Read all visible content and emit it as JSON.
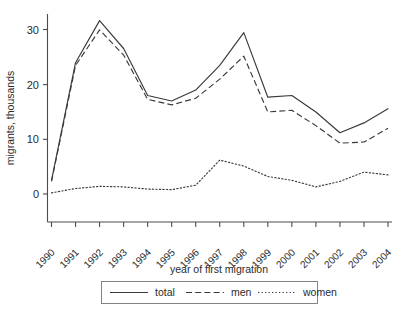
{
  "chart_data": {
    "type": "line",
    "title": "",
    "xlabel": "year of first migration",
    "ylabel": "migrants, thousands",
    "categories": [
      "1990",
      "1991",
      "1992",
      "1993",
      "1994",
      "1995",
      "1996",
      "1997",
      "1998",
      "1999",
      "2000",
      "2001",
      "2002",
      "2003",
      "2004"
    ],
    "x": [
      1990,
      1991,
      1992,
      1993,
      1994,
      1995,
      1996,
      1997,
      1998,
      1999,
      2000,
      2001,
      2002,
      2003,
      2004
    ],
    "series": [
      {
        "name": "total",
        "style": "solid",
        "values": [
          2.5,
          24.0,
          31.7,
          26.6,
          18.0,
          17.0,
          19.0,
          23.5,
          29.5,
          17.7,
          18.0,
          15.0,
          11.2,
          13.0,
          15.6
        ]
      },
      {
        "name": "men",
        "style": "dashed",
        "values": [
          2.3,
          23.5,
          30.0,
          25.4,
          17.3,
          16.3,
          17.5,
          21.0,
          25.2,
          15.0,
          15.3,
          12.5,
          9.3,
          9.5,
          12.0
        ]
      },
      {
        "name": "women",
        "style": "dotted",
        "values": [
          0.2,
          1.0,
          1.4,
          1.3,
          0.9,
          0.8,
          1.6,
          6.2,
          5.1,
          3.2,
          2.5,
          1.3,
          2.3,
          4.0,
          3.5
        ]
      }
    ],
    "ylim": [
      0,
      33
    ],
    "yticks": [
      0,
      10,
      20,
      30
    ],
    "ytick_labels": [
      "0",
      "10",
      "20",
      "30"
    ],
    "xlim": [
      1990,
      2004
    ],
    "grid": false,
    "legend_position": "bottom",
    "legend_entries": [
      "total",
      "men",
      "women"
    ],
    "axis_color": "#4d4d4d",
    "line_color": "#3a3a3a",
    "background": "#ffffff"
  },
  "legend": {
    "total_label": "total",
    "men_label": "men",
    "women_label": "women"
  },
  "axes": {
    "y_title": "migrants, thousands",
    "x_title": "year of first migration"
  }
}
